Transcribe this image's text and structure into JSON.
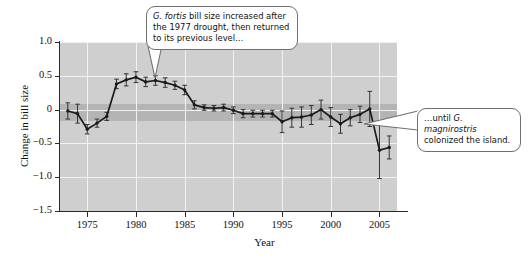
{
  "figure": {
    "axis_title_x": "Year",
    "axis_title_y": "Change in bill size"
  },
  "annotations": [
    {
      "name": "callout-left",
      "line1_italic": "G. fortis",
      "line1_rest": " bill size increased after",
      "line2": "the 1977 drought, then returned",
      "line3": "to its previous level…"
    },
    {
      "name": "callout-right",
      "line1_pre": "…until ",
      "line1_italic": "G. magnirostris",
      "line2": "colonized the island."
    }
  ],
  "chart_data": {
    "type": "line",
    "title": "",
    "xlabel": "Year",
    "ylabel": "Change in bill size",
    "xlim": [
      1972.2,
      2006.8
    ],
    "ylim": [
      -1.5,
      1.0
    ],
    "yticks": [
      1.0,
      0.5,
      0,
      -0.5,
      -1.0,
      -1.5
    ],
    "ytick_labels": [
      "1.0",
      "0.5",
      "0",
      "−0.5",
      "−1.0",
      "−1.5"
    ],
    "xticks": [
      1975,
      1980,
      1985,
      1990,
      1995,
      2000,
      2005
    ],
    "xtick_labels": [
      "1975",
      "1980",
      "1985",
      "1990",
      "1995",
      "2000",
      "2005"
    ],
    "grid": true,
    "legend": "none",
    "plot_bgcolor": "#cfcfcf",
    "band_color": "#b4b4b4",
    "band_range": [
      -0.17,
      0.08
    ],
    "line_color": "#1a1a1a",
    "errorbar_color": "#333333",
    "series": [
      {
        "name": "G. fortis change in bill size",
        "x": [
          1973,
          1974,
          1975,
          1976,
          1977,
          1978,
          1979,
          1980,
          1981,
          1982,
          1983,
          1984,
          1985,
          1986,
          1987,
          1988,
          1989,
          1990,
          1991,
          1992,
          1993,
          1994,
          1995,
          1996,
          1997,
          1998,
          1999,
          2000,
          2001,
          2002,
          2003,
          2004,
          2005,
          2006
        ],
        "values": [
          -0.02,
          -0.06,
          -0.29,
          -0.2,
          -0.1,
          0.38,
          0.44,
          0.48,
          0.41,
          0.43,
          0.4,
          0.36,
          0.29,
          0.07,
          0.03,
          0.02,
          0.03,
          -0.01,
          -0.06,
          -0.06,
          -0.06,
          -0.06,
          -0.18,
          -0.12,
          -0.11,
          -0.08,
          0.0,
          -0.11,
          -0.21,
          -0.12,
          -0.07,
          0.01,
          -0.6,
          -0.56
        ],
        "err_low": [
          0.12,
          0.14,
          0.07,
          0.06,
          0.06,
          0.07,
          0.09,
          0.08,
          0.07,
          0.07,
          0.07,
          0.06,
          0.07,
          0.06,
          0.04,
          0.04,
          0.05,
          0.05,
          0.06,
          0.05,
          0.05,
          0.05,
          0.16,
          0.14,
          0.15,
          0.14,
          0.14,
          0.14,
          0.14,
          0.12,
          0.12,
          0.26,
          0.42,
          0.17
        ],
        "err_high": [
          0.12,
          0.14,
          0.07,
          0.06,
          0.06,
          0.07,
          0.09,
          0.08,
          0.07,
          0.07,
          0.07,
          0.06,
          0.07,
          0.06,
          0.04,
          0.04,
          0.05,
          0.05,
          0.06,
          0.05,
          0.05,
          0.05,
          0.16,
          0.14,
          0.15,
          0.14,
          0.14,
          0.14,
          0.14,
          0.12,
          0.12,
          0.26,
          0.42,
          0.17
        ]
      }
    ]
  }
}
